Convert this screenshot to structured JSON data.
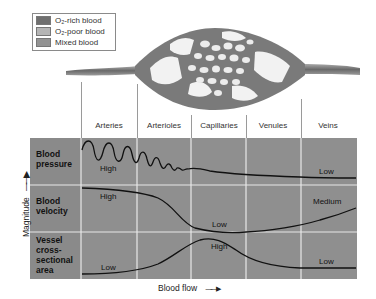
{
  "legend": {
    "items": [
      {
        "label": "O₂-rich blood",
        "color": "#6f6f6f"
      },
      {
        "label": "O₂-poor blood",
        "color": "#b5b5b5"
      },
      {
        "label": "Mixed blood",
        "color": "#939393"
      }
    ]
  },
  "columns": [
    "Arteries",
    "Arterioles",
    "Capillaries",
    "Venules",
    "Veins"
  ],
  "rows": [
    {
      "label_lines": [
        "Blood",
        "pressure"
      ],
      "curve_labels": [
        "High",
        "Low"
      ]
    },
    {
      "label_lines": [
        "Blood",
        "velocity"
      ],
      "curve_labels": [
        "High",
        "Low",
        "Medium"
      ]
    },
    {
      "label_lines": [
        "Vessel",
        "cross-",
        "sectional",
        "area"
      ],
      "curve_labels": [
        "Low",
        "High",
        "Low"
      ]
    }
  ],
  "axes": {
    "y_label": "Magnitude",
    "y_arrow": "→",
    "x_label": "Blood flow",
    "x_arrow": "→"
  },
  "colors": {
    "grid_bg": "#8f8f8f",
    "grid_lines": "#e6e6e6",
    "curve": "#111111",
    "vessel": "#7d7d7d"
  }
}
